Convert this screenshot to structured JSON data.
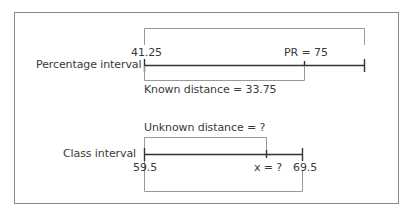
{
  "diagram": {
    "percentage_row": {
      "label": "Percentage interval",
      "start_value": "41.25",
      "marker_label": "PR = 75",
      "known_distance_label": "Known distance = 33.75"
    },
    "class_row": {
      "label": "Class interval",
      "start_value": "59.5",
      "end_value": "69.5",
      "marker_label": "x = ?",
      "unknown_distance_label": "Unknown distance = ?"
    },
    "colors": {
      "line": "#333333",
      "bracket": "#999999",
      "frame": "#8a8a8a"
    }
  }
}
